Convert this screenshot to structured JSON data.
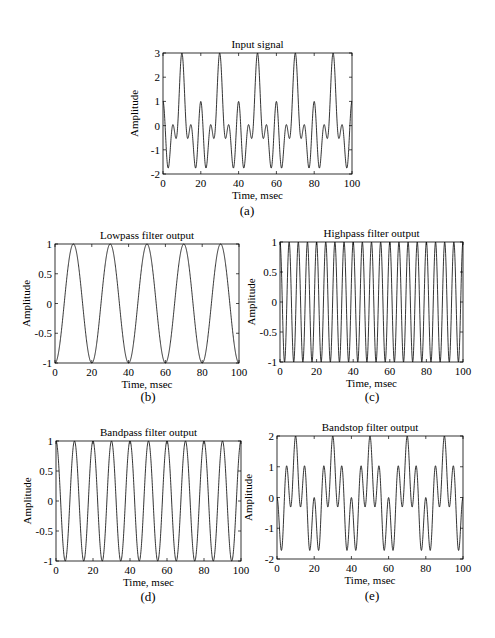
{
  "chart_data": [
    {
      "id": "a",
      "type": "line",
      "title": "Input signal",
      "xlabel": "Time, msec",
      "ylabel": "Amplitude",
      "caption": "(a)",
      "xlim": [
        0,
        100
      ],
      "ylim": [
        -2,
        3
      ],
      "xticks": [
        0,
        20,
        40,
        60,
        80,
        100
      ],
      "yticks": [
        -2,
        -1,
        0,
        1,
        2,
        3
      ],
      "ytick_labels": [
        "-2",
        "-1",
        "0",
        "1",
        "2",
        "3"
      ],
      "series": [
        {
          "name": "input",
          "components": [
            {
              "amp": -1,
              "freq_hz": 50
            },
            {
              "amp": 1,
              "freq_hz": 100
            },
            {
              "amp": 1,
              "freq_hz": 200
            }
          ]
        }
      ],
      "box": {
        "x0": 163,
        "y0": 53,
        "x1": 352,
        "y1": 174
      },
      "caption_pos": {
        "x": 247,
        "y": 215
      }
    },
    {
      "id": "b",
      "type": "line",
      "title": "Lowpass filter output",
      "xlabel": "Time, msec",
      "ylabel": "Amplitude",
      "caption": "(b)",
      "xlim": [
        0,
        100
      ],
      "ylim": [
        -1,
        1
      ],
      "xticks": [
        0,
        20,
        40,
        60,
        80,
        100
      ],
      "yticks": [
        -1,
        -0.5,
        0,
        0.5,
        1
      ],
      "ytick_labels": [
        "-1",
        "-0.5",
        "0",
        "0.5",
        "1"
      ],
      "series": [
        {
          "name": "lowpass",
          "components": [
            {
              "amp": -1,
              "freq_hz": 50
            }
          ]
        }
      ],
      "box": {
        "x0": 55,
        "y0": 244,
        "x1": 239,
        "y1": 363
      },
      "caption_pos": {
        "x": 148,
        "y": 401
      }
    },
    {
      "id": "c",
      "type": "line",
      "title": "Highpass filter output",
      "xlabel": "Time, msec",
      "ylabel": "Amplitude",
      "caption": "(c)",
      "xlim": [
        0,
        100
      ],
      "ylim": [
        -1,
        1
      ],
      "xticks": [
        0,
        20,
        40,
        60,
        80,
        100
      ],
      "yticks": [
        -1,
        -0.5,
        0,
        0.5,
        1
      ],
      "ytick_labels": [
        "-1",
        "-0.5",
        "0",
        "0.5",
        "1"
      ],
      "series": [
        {
          "name": "highpass",
          "components": [
            {
              "amp": 1,
              "freq_hz": 200
            }
          ]
        }
      ],
      "box": {
        "x0": 280,
        "y0": 242,
        "x1": 463,
        "y1": 362
      },
      "caption_pos": {
        "x": 372,
        "y": 401
      }
    },
    {
      "id": "d",
      "type": "line",
      "title": "Bandpass filter output",
      "xlabel": "Time, msec",
      "ylabel": "Amplitude",
      "caption": "(d)",
      "xlim": [
        0,
        100
      ],
      "ylim": [
        -1,
        1
      ],
      "xticks": [
        0,
        20,
        40,
        60,
        80,
        100
      ],
      "yticks": [
        -1,
        -0.5,
        0,
        0.5,
        1
      ],
      "ytick_labels": [
        "-1",
        "-0.5",
        "0",
        "0.5",
        "1"
      ],
      "series": [
        {
          "name": "bandpass",
          "components": [
            {
              "amp": 1,
              "freq_hz": 100
            }
          ]
        }
      ],
      "box": {
        "x0": 56,
        "y0": 441,
        "x1": 241,
        "y1": 561
      },
      "caption_pos": {
        "x": 148,
        "y": 601
      }
    },
    {
      "id": "e",
      "type": "line",
      "title": "Bandstop filter output",
      "xlabel": "Time, msec",
      "ylabel": "Amplitude",
      "caption": "(e)",
      "xlim": [
        0,
        100
      ],
      "ylim": [
        -2,
        2
      ],
      "xticks": [
        0,
        20,
        40,
        60,
        80,
        100
      ],
      "yticks": [
        -2,
        -1,
        0,
        1,
        2
      ],
      "ytick_labels": [
        "-2",
        "-1",
        "0",
        "1",
        "2"
      ],
      "series": [
        {
          "name": "bandstop",
          "components": [
            {
              "amp": -1,
              "freq_hz": 50
            },
            {
              "amp": 1,
              "freq_hz": 200
            }
          ]
        }
      ],
      "box": {
        "x0": 277,
        "y0": 436,
        "x1": 463,
        "y1": 559
      },
      "caption_pos": {
        "x": 372,
        "y": 600
      }
    }
  ],
  "style": {
    "line_color": "#000000",
    "axis_color": "#000000",
    "background": "#ffffff"
  }
}
